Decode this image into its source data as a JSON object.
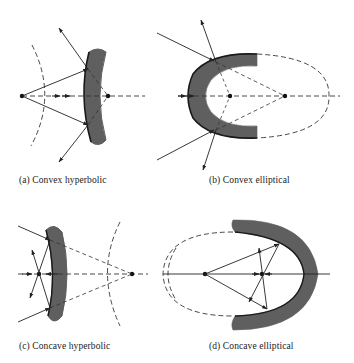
{
  "figure": {
    "panels": [
      {
        "id": "a",
        "caption": "(a) Convex hyperbolic",
        "mirror_type": "convex",
        "surface": "hyperbolic"
      },
      {
        "id": "b",
        "caption": "(b) Convex elliptical",
        "mirror_type": "convex",
        "surface": "elliptical"
      },
      {
        "id": "c",
        "caption": "(c) Concave hyperbolic",
        "mirror_type": "concave",
        "surface": "hyperbolic"
      },
      {
        "id": "d",
        "caption": "(d) Concave elliptical",
        "mirror_type": "concave",
        "surface": "elliptical"
      }
    ],
    "colors": {
      "mirror_fill": "#5f5f5f",
      "mirror_edge": "#1a1a1a",
      "line": "#222222",
      "dashed": "#333333",
      "background": "#ffffff"
    }
  }
}
